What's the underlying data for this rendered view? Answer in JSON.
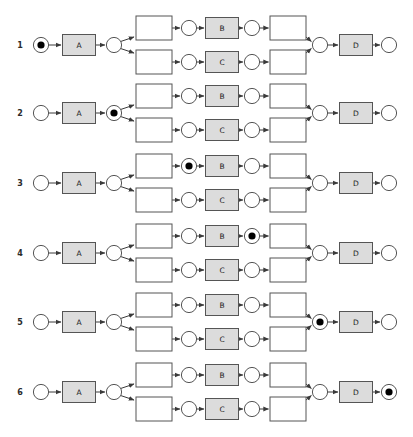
{
  "diagram": {
    "kind": "petri-net-sequence",
    "colors": {
      "background": "#ffffff",
      "stroke": "#555555",
      "place_fill": "#ffffff",
      "transition_labeled_fill": "#dcdcdc",
      "transition_silent_fill": "#ffffff",
      "token_fill": "#000000",
      "label_text": "#2b2b2b"
    },
    "activity_labels": {
      "a": "A",
      "b": "B",
      "c": "C",
      "d": "D"
    },
    "node_names": {
      "start_place": "start-place",
      "transition_a": "transition-a",
      "split_place": "split-place",
      "silent_split_upper": "silent-transition-split-upper",
      "silent_split_lower": "silent-transition-split-lower",
      "place_before_b": "place-before-b",
      "place_before_c": "place-before-c",
      "transition_b": "transition-b",
      "transition_c": "transition-c",
      "place_after_b": "place-after-b",
      "place_after_c": "place-after-c",
      "silent_join_upper": "silent-transition-join-upper",
      "silent_join_lower": "silent-transition-join-lower",
      "join_place": "join-place",
      "transition_d": "transition-d",
      "end_place": "end-place"
    },
    "rows": [
      {
        "label": "1",
        "token_at": "start_place"
      },
      {
        "label": "2",
        "token_at": "split_place"
      },
      {
        "label": "3",
        "token_at": "place_before_b"
      },
      {
        "label": "4",
        "token_at": "place_after_b"
      },
      {
        "label": "5",
        "token_at": "join_place"
      },
      {
        "label": "6",
        "token_at": "end_place"
      }
    ]
  }
}
